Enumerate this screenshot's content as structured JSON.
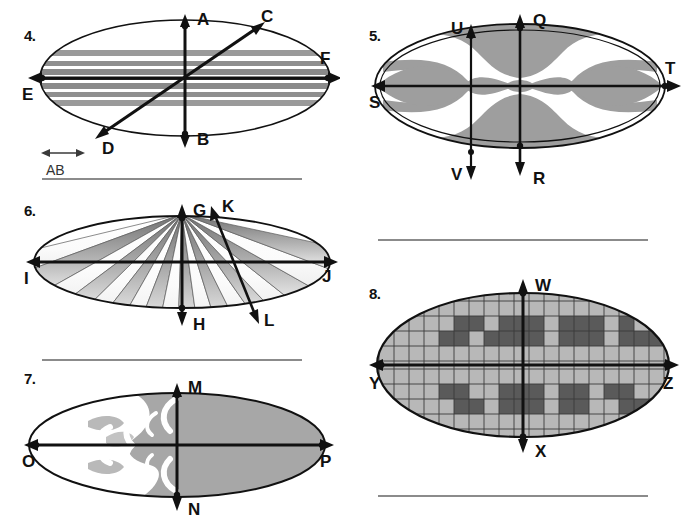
{
  "page": {
    "background": "#ffffff",
    "width": 687,
    "height": 528
  },
  "colors": {
    "ink": "#111111",
    "rule": "#8b8b8b",
    "stripe_gray": "#9a9a9a",
    "stripe_dark": "#6e6e6e",
    "fill_gray": "#a0a0a0",
    "grid_light": "#b8b8b8",
    "grid_dark": "#5a5a5a",
    "grid_line": "#2a2a2a",
    "white": "#ffffff"
  },
  "figures": [
    {
      "id": "fig4",
      "number": "4.",
      "pattern": "horizontal-stripes",
      "labels": {
        "up": "A",
        "down": "B",
        "left": "E",
        "right": "F",
        "diag_up": "C",
        "diag_down": "D"
      },
      "scale_bar": {
        "label": "AB",
        "arrow": "double-headed"
      }
    },
    {
      "id": "fig5",
      "number": "5.",
      "pattern": "symmetric-curved-lobes",
      "labels": {
        "up_center": "Q",
        "down_center": "R",
        "up_left": "U",
        "down_left": "V",
        "left": "S",
        "right": "T"
      }
    },
    {
      "id": "fig6",
      "number": "6.",
      "pattern": "radial-wedges-gradient",
      "labels": {
        "up": "G",
        "down": "H",
        "left": "I",
        "right": "J",
        "diag_up": "K",
        "diag_down": "L"
      }
    },
    {
      "id": "fig7",
      "number": "7.",
      "pattern": "half-gray-with-white-crescents",
      "labels": {
        "up": "M",
        "down": "N",
        "left": "O",
        "right": "P"
      }
    },
    {
      "id": "fig8",
      "number": "8.",
      "pattern": "checkerboard-grid-blocks",
      "labels": {
        "up": "W",
        "down": "X",
        "left": "Y",
        "right": "Z"
      },
      "grid": {
        "columns": 20,
        "rows": 10
      }
    }
  ],
  "rules": [
    {
      "name": "rule-under-fig4",
      "x": 42,
      "y": 178,
      "width": 260
    },
    {
      "name": "rule-right-upper",
      "x": 378,
      "y": 239,
      "width": 270
    },
    {
      "name": "rule-under-fig6",
      "x": 42,
      "y": 359,
      "width": 260
    },
    {
      "name": "rule-bottom-right",
      "x": 378,
      "y": 495,
      "width": 270
    }
  ]
}
